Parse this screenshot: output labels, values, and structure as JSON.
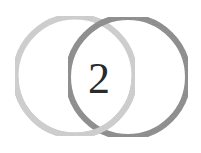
{
  "logo": {
    "numeral": "2",
    "rings": [
      {
        "name": "left-ring",
        "color": "#cfcfcf"
      },
      {
        "name": "right-ring",
        "color": "#8a8a8a"
      }
    ],
    "numeral_color": "#2a2a2a"
  }
}
